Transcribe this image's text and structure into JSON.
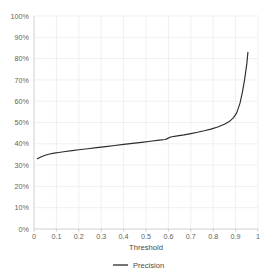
{
  "chart_data": {
    "type": "line",
    "title": "",
    "xlabel": "Threshold",
    "ylabel": "",
    "xlim": [
      0,
      1
    ],
    "ylim": [
      0,
      1
    ],
    "grid": true,
    "legend_position": "bottom",
    "x_ticks": [
      "0",
      "0.1",
      "0.2",
      "0.3",
      "0.4",
      "0.5",
      "0.6",
      "0.7",
      "0.8",
      "0.9",
      "1"
    ],
    "x_tick_values": [
      0,
      0.1,
      0.2,
      0.3,
      0.4,
      0.5,
      0.6,
      0.7,
      0.8,
      0.9,
      1
    ],
    "y_ticks": [
      "0%",
      "10%",
      "20%",
      "30%",
      "40%",
      "50%",
      "60%",
      "70%",
      "80%",
      "90%",
      "100%"
    ],
    "y_tick_values": [
      0,
      0.1,
      0.2,
      0.3,
      0.4,
      0.5,
      0.6,
      0.7,
      0.8,
      0.9,
      1
    ],
    "series": [
      {
        "name": "Precision",
        "color": "#2b2b2b",
        "x": [
          0.015,
          0.03,
          0.05,
          0.07,
          0.09,
          0.11,
          0.14,
          0.17,
          0.2,
          0.24,
          0.28,
          0.32,
          0.36,
          0.4,
          0.44,
          0.48,
          0.52,
          0.56,
          0.585,
          0.59,
          0.61,
          0.64,
          0.67,
          0.7,
          0.73,
          0.76,
          0.79,
          0.82,
          0.85,
          0.87,
          0.89,
          0.905,
          0.92,
          0.93,
          0.94,
          0.95,
          0.955
        ],
        "values": [
          0.33,
          0.338,
          0.346,
          0.352,
          0.356,
          0.359,
          0.364,
          0.368,
          0.372,
          0.377,
          0.382,
          0.387,
          0.392,
          0.397,
          0.402,
          0.407,
          0.412,
          0.417,
          0.42,
          0.422,
          0.432,
          0.437,
          0.442,
          0.448,
          0.454,
          0.461,
          0.469,
          0.479,
          0.492,
          0.503,
          0.522,
          0.545,
          0.592,
          0.64,
          0.7,
          0.775,
          0.83
        ]
      }
    ],
    "legend": [
      {
        "label": "Precision",
        "color": "#2b2b2b",
        "marker": "line"
      }
    ],
    "annotations": []
  },
  "axes": {
    "x_axis_title": "Threshold"
  }
}
